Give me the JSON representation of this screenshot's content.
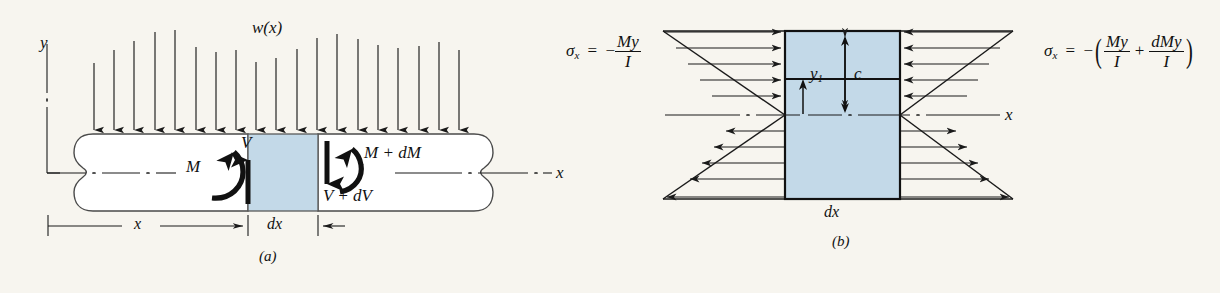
{
  "figure": {
    "background_color": "#f7f5ef",
    "shade_color": "#c3d9e8",
    "line_color": "#1a1a1a",
    "panels": [
      {
        "id": "a",
        "caption": "(a)",
        "title": "Beam element with distributed load, shear and moment"
      },
      {
        "id": "b",
        "caption": "(b)",
        "title": "Bending stress distribution on element faces"
      }
    ]
  },
  "panel_a": {
    "caption": "(a)",
    "axis_y_label": "y",
    "axis_x_label": "x",
    "distributed_load_label": "w(x)",
    "moment_left_label": "M",
    "shear_left_label": "V",
    "moment_right_label": "M + dM",
    "shear_right_label": "V + dV",
    "dimension_x_label": "x",
    "dimension_dx_label": "dx",
    "arrow_count": 18
  },
  "panel_b": {
    "caption": "(b)",
    "axis_x_label": "x",
    "dimension_dx_label": "dx",
    "dimension_c_label": "c",
    "dimension_y1_label": "y",
    "dimension_y1_sub": "1",
    "stress_left": {
      "sigma": "σ",
      "sigma_sub": "x",
      "equals": "=",
      "minus": "−",
      "numerator": "My",
      "denominator": "I",
      "full_text": "σx = −My/I"
    },
    "stress_right": {
      "sigma": "σ",
      "sigma_sub": "x",
      "equals": "=",
      "minus": "−",
      "term1_numerator": "My",
      "term1_denominator": "I",
      "plus": "+",
      "term2_numerator": "dMy",
      "term2_denominator": "I",
      "full_text": "σx = −(My/I + dMy/I)"
    },
    "left_arrow_count": 11,
    "right_arrow_count": 11
  }
}
